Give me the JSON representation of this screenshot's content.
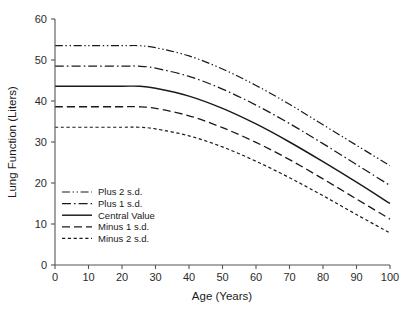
{
  "chart_data": {
    "type": "line",
    "title": "",
    "xlabel": "Age (Years)",
    "ylabel": "Lung Function (Liters)",
    "xlim": [
      0,
      100
    ],
    "ylim": [
      0,
      60
    ],
    "xticks": [
      "0",
      "10",
      "20",
      "30",
      "40",
      "50",
      "60",
      "70",
      "80",
      "90",
      "100"
    ],
    "yticks": [
      "0",
      "10",
      "20",
      "30",
      "40",
      "50",
      "60"
    ],
    "grid": false,
    "legend_position": "lower-left-inside",
    "x": [
      0,
      10,
      20,
      25,
      30,
      40,
      50,
      60,
      70,
      80,
      90,
      100
    ],
    "series": [
      {
        "name": "Plus 2 s.d.",
        "dash": "dash-dot-dot",
        "values": [
          53.5,
          53.5,
          53.5,
          53.5,
          53.0,
          51.0,
          47.8,
          43.8,
          39.2,
          34.2,
          29.2,
          24.2
        ]
      },
      {
        "name": "Plus 1 s.d.",
        "dash": "dash-dot",
        "values": [
          48.5,
          48.5,
          48.5,
          48.5,
          48.0,
          46.0,
          42.9,
          39.0,
          34.5,
          29.6,
          24.5,
          19.4
        ]
      },
      {
        "name": "Central Value",
        "dash": "solid",
        "values": [
          43.6,
          43.6,
          43.6,
          43.6,
          43.1,
          41.2,
          38.2,
          34.4,
          30.0,
          25.2,
          20.2,
          15.0
        ]
      },
      {
        "name": "Minus 1 s.d.",
        "dash": "long-dash",
        "values": [
          38.6,
          38.6,
          38.6,
          38.6,
          38.2,
          36.4,
          33.5,
          29.9,
          25.7,
          21.0,
          16.1,
          11.2
        ]
      },
      {
        "name": "Minus 2 s.d.",
        "dash": "short-dash",
        "values": [
          33.6,
          33.6,
          33.6,
          33.6,
          33.2,
          31.5,
          28.8,
          25.3,
          21.3,
          16.9,
          12.3,
          7.8
        ]
      }
    ]
  },
  "legend": {
    "items": [
      {
        "label": "Plus 2 s.d."
      },
      {
        "label": "Plus 1 s.d."
      },
      {
        "label": "Central Value"
      },
      {
        "label": "Minus 1 s.d."
      },
      {
        "label": "Minus 2 s.d."
      }
    ]
  }
}
